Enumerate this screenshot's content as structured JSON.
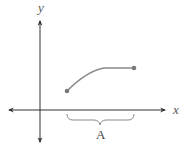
{
  "diagram": {
    "title": "",
    "x_axis_label": "x",
    "y_axis_label": "y",
    "curve": {
      "description": "increasing, concave-down curve segment that levels off, with closed endpoints",
      "start_point": "closed",
      "end_point": "closed",
      "color": "#8a8a8a"
    },
    "interval": {
      "label": "A",
      "description": "brace under x-axis spanning the domain of the curve"
    },
    "colors": {
      "axes": "#333333",
      "curve": "#8a8a8a",
      "brace": "#8a8a8a",
      "text": "#444444"
    }
  }
}
